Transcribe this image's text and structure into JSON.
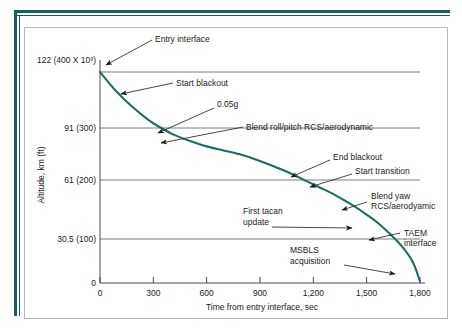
{
  "figure": {
    "frame_color": "#15605f",
    "box_border_color": "#b9b9b9"
  },
  "chart_data": {
    "type": "line",
    "title": "",
    "xlabel": "Time from entry interface, sec",
    "ylabel": "Altitude, km (ft)",
    "xlim": [
      0,
      1800
    ],
    "ylim": [
      0,
      122
    ],
    "grid": true,
    "legend": "none",
    "line_color": "#1d6b6b",
    "xticks": [
      0,
      300,
      600,
      900,
      1200,
      1500,
      1800
    ],
    "xticklabels": [
      "0",
      "300",
      "600",
      "900",
      "1,200",
      "1,500",
      "1,800"
    ],
    "yticks": [
      0,
      30.5,
      61,
      91,
      122
    ],
    "yticklabels": [
      "0",
      "30.5 (100)",
      "61 (200)",
      "91 (300)",
      "122 (400 X 10³)"
    ],
    "gridlines_y": [
      30.5,
      61,
      91,
      122
    ],
    "series": [
      {
        "name": "Entry trajectory",
        "x": [
          0,
          90,
          180,
          270,
          330,
          420,
          510,
          600,
          700,
          800,
          900,
          1000,
          1070,
          1150,
          1230,
          1320,
          1420,
          1500,
          1560,
          1630,
          1700,
          1760,
          1800
        ],
        "y": [
          122,
          111,
          102,
          94.5,
          90.5,
          85.5,
          82,
          79,
          76.5,
          74,
          70.5,
          66.5,
          63.5,
          59.5,
          55.5,
          51,
          45,
          39.5,
          35,
          28.5,
          21,
          12,
          1
        ]
      }
    ],
    "annotations": [
      {
        "label": "Entry interface",
        "x": 0,
        "y": 122
      },
      {
        "label": "Start blackout",
        "x": 170,
        "y": 103
      },
      {
        "label": "0.05g",
        "x": 335,
        "y": 90
      },
      {
        "label": "Blend roll/pitch RCS/aerodynamic",
        "x": 455,
        "y": 83.5
      },
      {
        "label": "End blackout",
        "x": 1070,
        "y": 61
      },
      {
        "label": "Start transition",
        "x": 1225,
        "y": 55.5
      },
      {
        "label": "Blend yaw RCS/aerodyamic",
        "x": 1430,
        "y": 44.5
      },
      {
        "label": "First tacan update",
        "x": 1495,
        "y": 36
      },
      {
        "label": "TAEM interface",
        "x": 1580,
        "y": 31.5
      },
      {
        "label": "MSBLS acquisition",
        "x": 1735,
        "y": 15
      }
    ]
  },
  "labels": {
    "y_122": "122 (400 X 10³)",
    "y_91": "91 (300)",
    "y_61": "61 (200)",
    "y_305": "30.5 (100)",
    "y_0": "0",
    "x_0": "0",
    "x_300": "300",
    "x_600": "600",
    "x_900": "900",
    "x_1200": "1,200",
    "x_1500": "1,500",
    "x_1800": "1,800",
    "x_axis_title": "Time from entry interface, sec",
    "y_axis_title": "Altitude, km (ft)",
    "a_entry_interface": "Entry interface",
    "a_start_blackout": "Start blackout",
    "a_005g": "0.05g",
    "a_blend_roll_pitch": "Blend roll/pitch RCS/aerodynamic",
    "a_end_blackout": "End blackout",
    "a_start_transition": "Start transition",
    "a_blend_yaw_1": "Blend yaw",
    "a_blend_yaw_2": "RCS/aerodyamic",
    "a_first_tacan_1": "First tacan",
    "a_first_tacan_2": "update",
    "a_taem_1": "TAEM",
    "a_taem_2": "interface",
    "a_msbls_1": "MSBLS",
    "a_msbls_2": "acquisition"
  }
}
